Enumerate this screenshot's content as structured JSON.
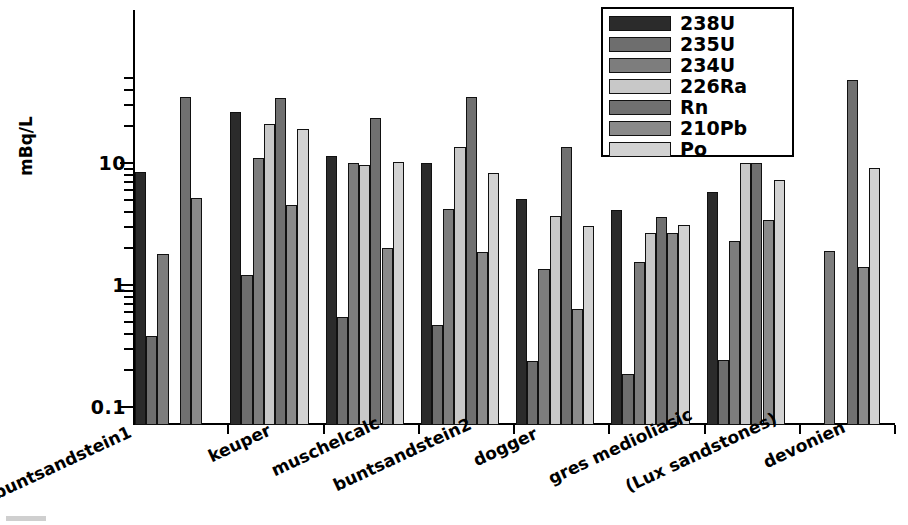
{
  "chart_data": {
    "type": "bar",
    "title": "",
    "xlabel": "",
    "ylabel": "mBq/L",
    "yscale": "log",
    "ylim": [
      0.1,
      50
    ],
    "ytick_labels": [
      "10",
      "1",
      "0.1"
    ],
    "ytick_values": [
      10,
      1,
      0.1
    ],
    "grid": false,
    "legend_position": "top-right",
    "categories": [
      "buntsandstein1",
      "keuper",
      "muschelcalc",
      "buntsandstein2",
      "dogger",
      "gres medioliasic",
      "(Lux sandstones)",
      "devonien"
    ],
    "series": [
      {
        "name": "238U",
        "color": "#2b2b2b",
        "values": [
          8.5,
          26.0,
          11.5,
          10.0,
          5.1,
          4.1,
          5.8,
          null
        ]
      },
      {
        "name": "235U",
        "color": "#6e6e6e",
        "values": [
          0.38,
          1.2,
          0.55,
          0.47,
          0.24,
          0.185,
          0.245,
          null
        ]
      },
      {
        "name": "234U",
        "color": "#7d7d7d",
        "values": [
          1.8,
          11.0,
          10.0,
          4.2,
          1.35,
          1.55,
          2.3,
          1.9
        ]
      },
      {
        "name": "226Ra",
        "color": "#c8c8c8",
        "values": [
          null,
          21.0,
          9.7,
          13.5,
          3.7,
          2.65,
          10.0,
          null
        ]
      },
      {
        "name": "Rn",
        "color": "#707070",
        "values": [
          35.0,
          34.0,
          23.5,
          35.0,
          13.5,
          3.6,
          10.0,
          48.0
        ]
      },
      {
        "name": "210Pb",
        "color": "#8a8a8a",
        "values": [
          5.2,
          4.5,
          2.0,
          1.85,
          0.63,
          2.65,
          3.4,
          1.4
        ]
      },
      {
        "name": "Po",
        "color": "#d2d2d2",
        "values": [
          null,
          19.0,
          10.2,
          8.3,
          3.05,
          3.1,
          7.3,
          9.1
        ]
      }
    ]
  },
  "legend": {
    "entries": [
      {
        "label": "238U",
        "color": "#2b2b2b"
      },
      {
        "label": "235U",
        "color": "#6e6e6e"
      },
      {
        "label": "234U",
        "color": "#7d7d7d"
      },
      {
        "label": "226Ra",
        "color": "#c8c8c8"
      },
      {
        "label": "Rn",
        "color": "#707070"
      },
      {
        "label": "210Pb",
        "color": "#8a8a8a"
      },
      {
        "label": "Po",
        "color": "#d2d2d2"
      }
    ]
  }
}
